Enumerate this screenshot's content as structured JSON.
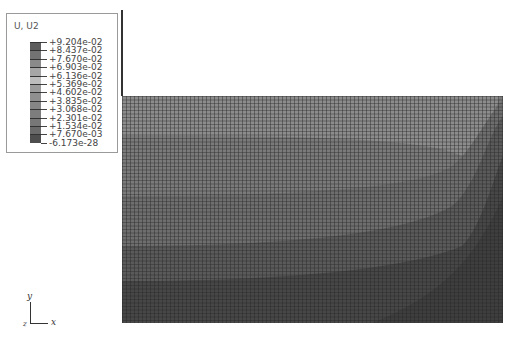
{
  "legend": {
    "title": "U, U2",
    "labels": [
      "+9.204e-02",
      "+8.437e-02",
      "+7.670e-02",
      "+6.903e-02",
      "+6.136e-02",
      "+5.369e-02",
      "+4.602e-02",
      "+3.835e-02",
      "+3.068e-02",
      "+2.301e-02",
      "+1.534e-02",
      "+7.670e-03",
      "-6.173e-28"
    ],
    "colors": [
      "#5c5c5c",
      "#737373",
      "#8a8a8a",
      "#a6a6a6",
      "#bdbdbd",
      "#9c9c9c",
      "#8f8f8f",
      "#858585",
      "#7d7d7d",
      "#777777",
      "#6a6a6a",
      "#4e4e4e",
      "#3c3c3c"
    ]
  },
  "triad": {
    "y_label": "y",
    "x_label": "x",
    "z_label": "z"
  },
  "mesh": {
    "band_colors": {
      "top": "#8c8c8c",
      "upper": "#7a7a7a",
      "mid": "#6e6e6e",
      "lower": "#5a5a5a",
      "bottom": "#474747",
      "corner": "#3e3e3e"
    },
    "line_color": "#2a2a2a"
  }
}
